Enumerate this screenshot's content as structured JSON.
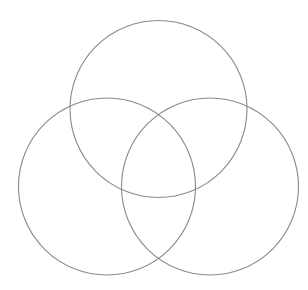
{
  "figure": {
    "type": "venn-diagram",
    "width": 308,
    "height": 290,
    "background_color": "#ffffff",
    "has_labels": false,
    "has_fill": false,
    "stroke_color": "#8a8a8a",
    "stroke_width": 1.1
  },
  "chart_data": {
    "type": "venn",
    "title": "",
    "subtitle": "",
    "xlabel": "",
    "ylabel": "",
    "set_count": 3,
    "legend_position": "none",
    "grid": false,
    "circles": [
      {
        "id": "top",
        "name": "top-circle",
        "label": "",
        "cx": 158.5,
        "cy": 109,
        "r": 88.5,
        "stroke": "#8a8a8a",
        "fill": "none"
      },
      {
        "id": "left",
        "name": "left-circle",
        "label": "",
        "cx": 107,
        "cy": 186.5,
        "r": 88.5,
        "stroke": "#8a8a8a",
        "fill": "none"
      },
      {
        "id": "right",
        "name": "right-circle",
        "label": "",
        "cx": 210,
        "cy": 186.5,
        "r": 88.5,
        "stroke": "#8a8a8a",
        "fill": "none"
      }
    ],
    "region_labels": [],
    "values": [],
    "annotations": []
  }
}
